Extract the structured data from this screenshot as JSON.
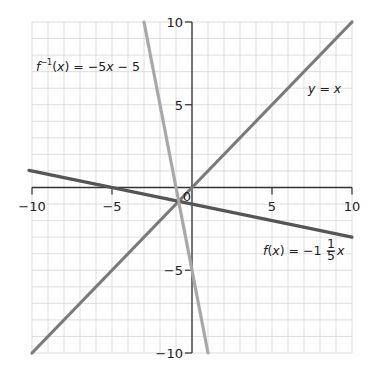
{
  "chart_data": {
    "type": "line",
    "title": "",
    "xlabel": "",
    "ylabel": "",
    "xlim": [
      -10,
      10
    ],
    "ylim": [
      -10,
      10
    ],
    "grid": true,
    "grid_step": 1,
    "x_ticks": [
      -10,
      -5,
      0,
      5,
      10
    ],
    "y_ticks": [
      -10,
      -5,
      5,
      10
    ],
    "x_tick_labels": [
      "−10",
      "−5",
      "0",
      "5",
      "10"
    ],
    "y_tick_labels": [
      "−10",
      "−5",
      "5",
      "10"
    ],
    "series": [
      {
        "name": "y = x",
        "slope": 1,
        "intercept": 0,
        "x": [
          -10,
          10
        ],
        "y": [
          -10,
          10
        ],
        "color": "#7a7a7a",
        "label_parts": {
          "a": "y",
          "b": " = ",
          "c": "x"
        }
      },
      {
        "name": "f(x) = −1 − (1/5)x",
        "slope": -0.2,
        "intercept": -1,
        "x": [
          -10,
          10
        ],
        "y": [
          1,
          -3
        ],
        "color": "#555555",
        "label_parts": {
          "f": "f",
          "paren": "(",
          "x": "x",
          "close": ") = −1 − ",
          "num": "1",
          "den": "5",
          "var": "x"
        }
      },
      {
        "name": "f⁻¹(x) = −5x − 5",
        "slope": -5,
        "intercept": -5,
        "x": [
          -3,
          1
        ],
        "y": [
          10,
          -10
        ],
        "color": "#a8a8a8",
        "label_parts": {
          "f": "f",
          "sup": "−1",
          "paren": "(",
          "x": "x",
          "close": ") = −5",
          "var": "x",
          "tail": " − 5"
        }
      }
    ]
  }
}
